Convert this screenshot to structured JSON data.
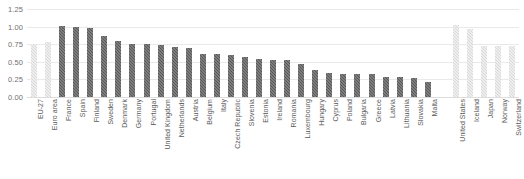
{
  "chart_data": {
    "type": "bar",
    "title": "",
    "subtitle": "",
    "xlabel": "",
    "ylabel": "",
    "ylim": [
      0,
      1.25
    ],
    "ytick_labels": [
      "1.25",
      "1.00",
      "0.75",
      "0.50",
      "0.25",
      "0.00"
    ],
    "ytick_values": [
      1.25,
      1.0,
      0.75,
      0.5,
      0.25,
      0.0
    ],
    "grid": true,
    "legend": "none",
    "colors": {
      "bar_dark": "#595959",
      "bar_light": "#d9d9d9",
      "gridline": "#e9e9e9",
      "axis_text": "#5a5a5a",
      "background": "#ffffff"
    },
    "categories": [
      "EU-27",
      "Euro area",
      "France",
      "Spain",
      "Finland",
      "Sweden",
      "Denmark",
      "Germany",
      "Portugal",
      "United Kingdom",
      "Netherlands",
      "Austria",
      "Belgium",
      "Italy",
      "Czech Republic",
      "Slovenia",
      "Estonia",
      "Ireland",
      "Romania",
      "Luxembourg",
      "Hungary",
      "Cyprus",
      "Poland",
      "Bulgaria",
      "Greece",
      "Latvia",
      "Lithuania",
      "Slovakia",
      "Malta",
      "",
      "United States",
      "Iceland",
      "Japan",
      "Norway",
      "Switzerland"
    ],
    "values": [
      0.76,
      0.78,
      1.01,
      1.0,
      0.98,
      0.86,
      0.79,
      0.76,
      0.76,
      0.74,
      0.71,
      0.69,
      0.61,
      0.61,
      0.6,
      0.57,
      0.54,
      0.53,
      0.52,
      0.47,
      0.39,
      0.34,
      0.33,
      0.33,
      0.32,
      0.28,
      0.28,
      0.27,
      0.22,
      0.0,
      1.02,
      0.97,
      0.73,
      0.73,
      0.73
    ],
    "series_groups": [
      {
        "name": "aggregate",
        "style": "light",
        "indices": [
          0,
          1
        ]
      },
      {
        "name": "european-country",
        "style": "dark",
        "indices": [
          2,
          3,
          4,
          5,
          6,
          7,
          8,
          9,
          10,
          11,
          12,
          13,
          14,
          15,
          16,
          17,
          18,
          19,
          20,
          21,
          22,
          23,
          24,
          25,
          26,
          27,
          28
        ]
      },
      {
        "name": "spacer",
        "style": "none",
        "indices": [
          29
        ]
      },
      {
        "name": "non-european-country",
        "style": "light",
        "indices": [
          30,
          31,
          32,
          33,
          34
        ]
      }
    ]
  }
}
